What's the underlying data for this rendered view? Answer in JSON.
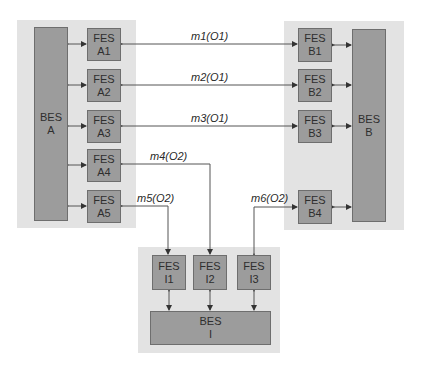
{
  "colors": {
    "panel": "#e3e3e3",
    "box": "#9c9c9c",
    "box_border": "#6e6e6e",
    "line": "#555555",
    "text": "#2e2e2e"
  },
  "systems": {
    "A": {
      "bes": {
        "line1": "BES",
        "line2": "A"
      },
      "fes": [
        {
          "line1": "FES",
          "line2": "A1"
        },
        {
          "line1": "FES",
          "line2": "A2"
        },
        {
          "line1": "FES",
          "line2": "A3"
        },
        {
          "line1": "FES",
          "line2": "A4"
        },
        {
          "line1": "FES",
          "line2": "A5"
        }
      ]
    },
    "B": {
      "bes": {
        "line1": "BES",
        "line2": "B"
      },
      "fes": [
        {
          "line1": "FES",
          "line2": "B1"
        },
        {
          "line1": "FES",
          "line2": "B2"
        },
        {
          "line1": "FES",
          "line2": "B3"
        },
        {
          "line1": "FES",
          "line2": "B4"
        }
      ]
    },
    "I": {
      "bes": {
        "line1": "BES",
        "line2": "I"
      },
      "fes": [
        {
          "line1": "FES",
          "line2": "I1"
        },
        {
          "line1": "FES",
          "line2": "I2"
        },
        {
          "line1": "FES",
          "line2": "I3"
        }
      ]
    }
  },
  "messages": [
    {
      "label": "m1(O1)",
      "from": "FES A1",
      "to": "FES B1"
    },
    {
      "label": "m2(O1)",
      "from": "FES A2",
      "to": "FES B2"
    },
    {
      "label": "m3(O1)",
      "from": "FES A3",
      "to": "FES B3"
    },
    {
      "label": "m4(O2)",
      "from": "FES I2",
      "to": "FES A4"
    },
    {
      "label": "m5(O2)",
      "from": "FES A5/I1",
      "to": "FES A5, FES I1"
    },
    {
      "label": "m6(O2)",
      "from": "FES I3/B4",
      "to": "FES B4, FES I3"
    }
  ]
}
